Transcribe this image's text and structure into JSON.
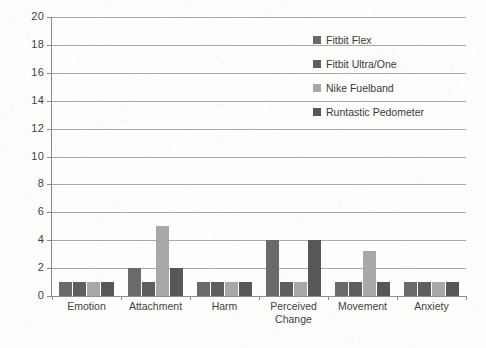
{
  "chart_data": {
    "type": "bar",
    "title": "",
    "xlabel": "",
    "ylabel": "",
    "ylim": [
      0,
      20
    ],
    "ytick_step": 2,
    "yticks": [
      0,
      2,
      4,
      6,
      8,
      10,
      12,
      14,
      16,
      18,
      20
    ],
    "grid": true,
    "legend_position": "top-right-inside",
    "categories": [
      "Emotion",
      "Attachment",
      "Harm",
      "Perceived Change",
      "Movement",
      "Anxiety"
    ],
    "series": [
      {
        "name": "Fitbit Flex",
        "color": "#6a6a6a",
        "values": [
          1,
          2,
          1,
          4,
          1,
          1
        ]
      },
      {
        "name": "Fitbit Ultra/One",
        "color": "#5e5e5e",
        "values": [
          1,
          1,
          1,
          1,
          1,
          1
        ]
      },
      {
        "name": "Nike Fuelband",
        "color": "#a8a8a8",
        "values": [
          1,
          5,
          1,
          1,
          3.2,
          1
        ]
      },
      {
        "name": "Runtastic Pedometer",
        "color": "#575757",
        "values": [
          1,
          2,
          1,
          4,
          1,
          1
        ]
      }
    ]
  },
  "legend": {
    "items": [
      {
        "label": "Fitbit Flex"
      },
      {
        "label": "Fitbit Ultra/One"
      },
      {
        "label": "Nike Fuelband"
      },
      {
        "label": "Runtastic Pedometer"
      }
    ]
  },
  "axes": {
    "y_tick_labels": [
      "20",
      "18",
      "16",
      "14",
      "12",
      "10",
      "8",
      "6",
      "4",
      "2",
      "0"
    ],
    "x_tick_labels": [
      "Emotion",
      "Attachment",
      "Harm",
      "Perceived Change",
      "Movement",
      "Anxiety"
    ]
  },
  "colors": {
    "gridline": "#a9a9a9",
    "axis": "#8a8a8a",
    "text": "#3f3f3f",
    "background": "#fdfdfc"
  }
}
